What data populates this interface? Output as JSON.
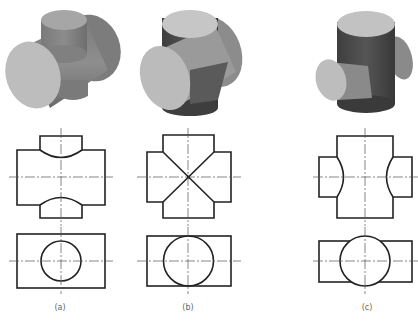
{
  "figure": {
    "panels": [
      {
        "id": "a",
        "label": "(a)",
        "case": "vertical cylinder smaller than horizontal"
      },
      {
        "id": "b",
        "label": "(b)",
        "case": "equal diameters"
      },
      {
        "id": "c",
        "label": "(c)",
        "case": "vertical cylinder larger than horizontal"
      }
    ]
  },
  "colors": {
    "line": "#222222",
    "centerline": "#555555",
    "shade_light": "#c8c8c8",
    "shade_mid": "#8a8a8a",
    "shade_dark": "#4a4a4a",
    "label": "#666666"
  }
}
